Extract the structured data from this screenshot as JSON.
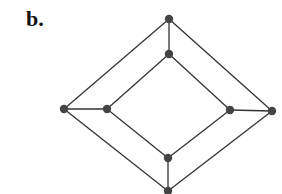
{
  "figure": {
    "panel_label": "b.",
    "colors": {
      "edge": "#333333",
      "node": "#444444",
      "background": "#ffffff"
    },
    "nodes": [
      {
        "id": "outer-top",
        "x": 169,
        "y": 19
      },
      {
        "id": "inner-top",
        "x": 169,
        "y": 54
      },
      {
        "id": "outer-left",
        "x": 64,
        "y": 109
      },
      {
        "id": "inner-left",
        "x": 107,
        "y": 109
      },
      {
        "id": "inner-right",
        "x": 230,
        "y": 110
      },
      {
        "id": "outer-right",
        "x": 272,
        "y": 111
      },
      {
        "id": "inner-bottom",
        "x": 168,
        "y": 158
      },
      {
        "id": "outer-bottom",
        "x": 168,
        "y": 191
      }
    ],
    "edges": [
      [
        "outer-top",
        "outer-left"
      ],
      [
        "outer-left",
        "outer-bottom"
      ],
      [
        "outer-bottom",
        "outer-right"
      ],
      [
        "outer-right",
        "outer-top"
      ],
      [
        "inner-top",
        "inner-left"
      ],
      [
        "inner-left",
        "inner-bottom"
      ],
      [
        "inner-bottom",
        "inner-right"
      ],
      [
        "inner-right",
        "inner-top"
      ],
      [
        "outer-top",
        "inner-top"
      ],
      [
        "outer-left",
        "inner-left"
      ],
      [
        "outer-right",
        "inner-right"
      ],
      [
        "outer-bottom",
        "inner-bottom"
      ]
    ]
  }
}
